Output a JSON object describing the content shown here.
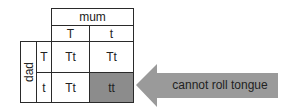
{
  "punnett": {
    "mum_label": "mum",
    "dad_label": "dad",
    "mum_alleles": [
      "T",
      "t"
    ],
    "dad_alleles": [
      "T",
      "t"
    ],
    "cells": [
      [
        "Tt",
        "Tt"
      ],
      [
        "Tt",
        "tt"
      ]
    ],
    "highlight_cell": "tt",
    "highlight_color": "#8c8c8c"
  },
  "annotation": {
    "label": "cannot roll tongue",
    "arrow_color": "#9a9a9a"
  }
}
